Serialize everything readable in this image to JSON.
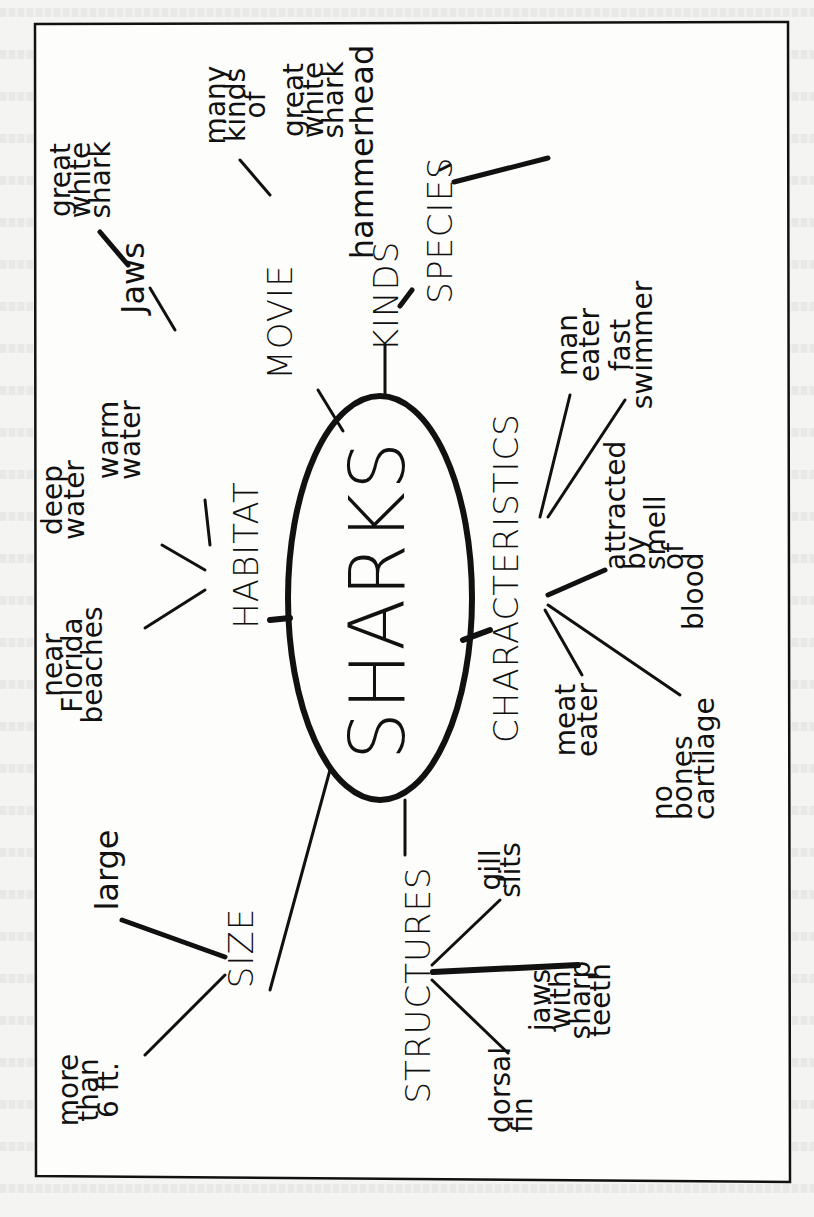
{
  "diagram": {
    "type": "semantic-map",
    "orientation": "rotated-90-ccw",
    "center": {
      "label": "SHARKS"
    },
    "branches": [
      {
        "id": "movie",
        "label": "MOVIE",
        "children": [
          {
            "label": "Jaws",
            "children": [
              {
                "label": "great white shark",
                "lines": [
                  "great",
                  "white",
                  "shark"
                ]
              }
            ]
          }
        ]
      },
      {
        "id": "kinds",
        "label": "KINDS",
        "children": [
          {
            "label": "SPECIES",
            "children": [
              {
                "label": "many kinds of",
                "lines": [
                  "many",
                  "kinds",
                  "of"
                ]
              },
              {
                "label": "great white shark",
                "lines": [
                  "great",
                  "white",
                  "shark"
                ]
              },
              {
                "label": "hammerhead",
                "lines": [
                  "hammerhead"
                ]
              }
            ]
          }
        ]
      },
      {
        "id": "habitat",
        "label": "HABITAT",
        "children": [
          {
            "label": "near Florida beaches",
            "lines": [
              "near",
              "Florida",
              "beaches"
            ]
          },
          {
            "label": "deep water",
            "lines": [
              "deep",
              "water"
            ]
          },
          {
            "label": "warm water",
            "lines": [
              "warm",
              "water"
            ]
          }
        ]
      },
      {
        "id": "characteristics",
        "label": "CHARACTERISTICS",
        "children": [
          {
            "label": "man eater",
            "lines": [
              "man",
              "eater"
            ]
          },
          {
            "label": "fast swimmer",
            "lines": [
              "fast",
              "swimmer"
            ]
          },
          {
            "label": "attracted by smell of blood",
            "lines": [
              "attracted",
              "by",
              "smell",
              "of",
              "blood"
            ]
          },
          {
            "label": "meat eater",
            "lines": [
              "meat",
              "eater"
            ]
          },
          {
            "label": "no bones cartilage",
            "lines": [
              "no",
              "bones",
              "cartilage"
            ]
          }
        ]
      },
      {
        "id": "size",
        "label": "SIZE",
        "children": [
          {
            "label": "large",
            "lines": [
              "large"
            ]
          },
          {
            "label": "more than 6 ft.",
            "lines": [
              "more",
              "than",
              "6 ft."
            ]
          }
        ]
      },
      {
        "id": "structures",
        "label": "STRUCTURES",
        "children": [
          {
            "label": "gill slits",
            "lines": [
              "gill",
              "slits"
            ]
          },
          {
            "label": "jaws with sharp teeth",
            "lines": [
              "jaws",
              "with",
              "sharp",
              "teeth"
            ]
          },
          {
            "label": "dorsal fin",
            "lines": [
              "dorsal",
              "fin"
            ]
          }
        ]
      }
    ]
  },
  "colors": {
    "ink": "#111111",
    "paper": "#f4f4f2"
  }
}
